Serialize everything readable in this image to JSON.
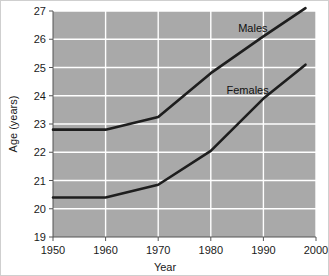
{
  "chart_data": {
    "type": "line",
    "title": "",
    "xlabel": "Year",
    "ylabel": "Age (years)",
    "xlim": [
      1950,
      2000
    ],
    "ylim": [
      19,
      27
    ],
    "xticks": [
      1950,
      1960,
      1970,
      1980,
      1990,
      2000
    ],
    "xtick_labels": [
      "1950",
      "1960",
      "1970",
      "1980",
      "1990",
      "2000"
    ],
    "yticks": [
      19,
      20,
      21,
      22,
      23,
      24,
      25,
      26,
      27
    ],
    "ytick_labels": [
      "19",
      "20",
      "21",
      "22",
      "23",
      "24",
      "25",
      "26",
      "27"
    ],
    "grid": true,
    "grid_color": "#ffffff",
    "plot_background": "#a9a9a9",
    "legend": "inline-annotations",
    "line_color": "#1e1e1e",
    "series": [
      {
        "name": "Males",
        "label": "Males",
        "x": [
          1950,
          1960,
          1970,
          1980,
          1990,
          1998
        ],
        "values": [
          22.8,
          22.8,
          23.25,
          24.8,
          26.1,
          27.1
        ],
        "annotation": {
          "text": "Males",
          "x": 1988,
          "y": 26.25
        }
      },
      {
        "name": "Females",
        "label": "Females",
        "x": [
          1950,
          1960,
          1970,
          1980,
          1990,
          1998
        ],
        "values": [
          20.4,
          20.4,
          20.85,
          22.05,
          23.9,
          25.1
        ],
        "annotation": {
          "text": "Females",
          "x": 1987,
          "y": 24.05
        }
      }
    ]
  },
  "axes": {
    "y_title": "Age (years)",
    "x_title": "Year"
  },
  "ticks": {
    "y": [
      "27",
      "26",
      "25",
      "24",
      "23",
      "22",
      "21",
      "20",
      "19"
    ],
    "x": [
      "1950",
      "1960",
      "1970",
      "1980",
      "1990",
      "2000"
    ]
  },
  "annotations": {
    "males": "Males",
    "females": "Females"
  }
}
